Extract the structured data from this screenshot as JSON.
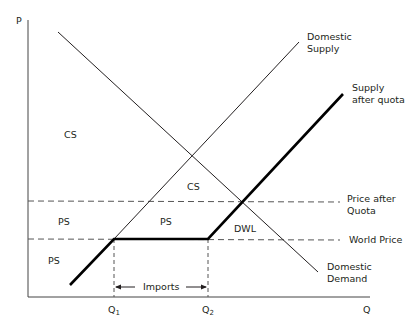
{
  "axes": {
    "y_label": "P",
    "x_label": "Q"
  },
  "curves": {
    "domestic_supply": [
      "Domestic",
      "Supply"
    ],
    "supply_after_quota": [
      "Supply",
      "after quota"
    ],
    "domestic_demand": [
      "Domestic",
      "Demand"
    ]
  },
  "prices": {
    "price_after_quota": [
      "Price after",
      "Quota"
    ],
    "world_price": "World Price"
  },
  "quantities": {
    "q1": "Q",
    "q1_sub": "1",
    "q2": "Q",
    "q2_sub": "2",
    "imports": "Imports"
  },
  "regions": {
    "cs_upper": "CS",
    "cs_lower": "CS",
    "ps_left_mid": "PS",
    "ps_center": "PS",
    "ps_bottom": "PS",
    "dwl": "DWL"
  },
  "colors": {
    "line": "#231f20",
    "dash": "#555555",
    "background": "#ffffff"
  }
}
